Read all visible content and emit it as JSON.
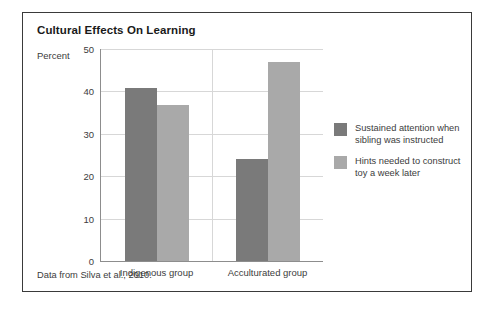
{
  "figure": {
    "title": "Cultural Effects On Learning",
    "source_note": "Data from Silva et al., 2010.",
    "frame_color": "#3a3a3a"
  },
  "chart_data": {
    "type": "bar",
    "title": "Cultural Effects On Learning",
    "xlabel": "",
    "ylabel": "Percent",
    "ylim": [
      0,
      50
    ],
    "yticks": [
      0,
      10,
      20,
      30,
      40,
      50
    ],
    "ytick_labels": [
      "0",
      "10",
      "20",
      "30",
      "40",
      "50"
    ],
    "grid": true,
    "legend_position": "right",
    "categories": [
      "Indigenous group",
      "Acculturated group"
    ],
    "series": [
      {
        "name": "Sustained attention when sibling was instructed",
        "color": "#7a7a7a",
        "values": [
          40.7,
          24
        ]
      },
      {
        "name": "Hints needed to construct toy a week later",
        "color": "#a9a9a9",
        "values": [
          36.8,
          47
        ]
      }
    ],
    "source": "Data from Silva et al., 2010."
  }
}
